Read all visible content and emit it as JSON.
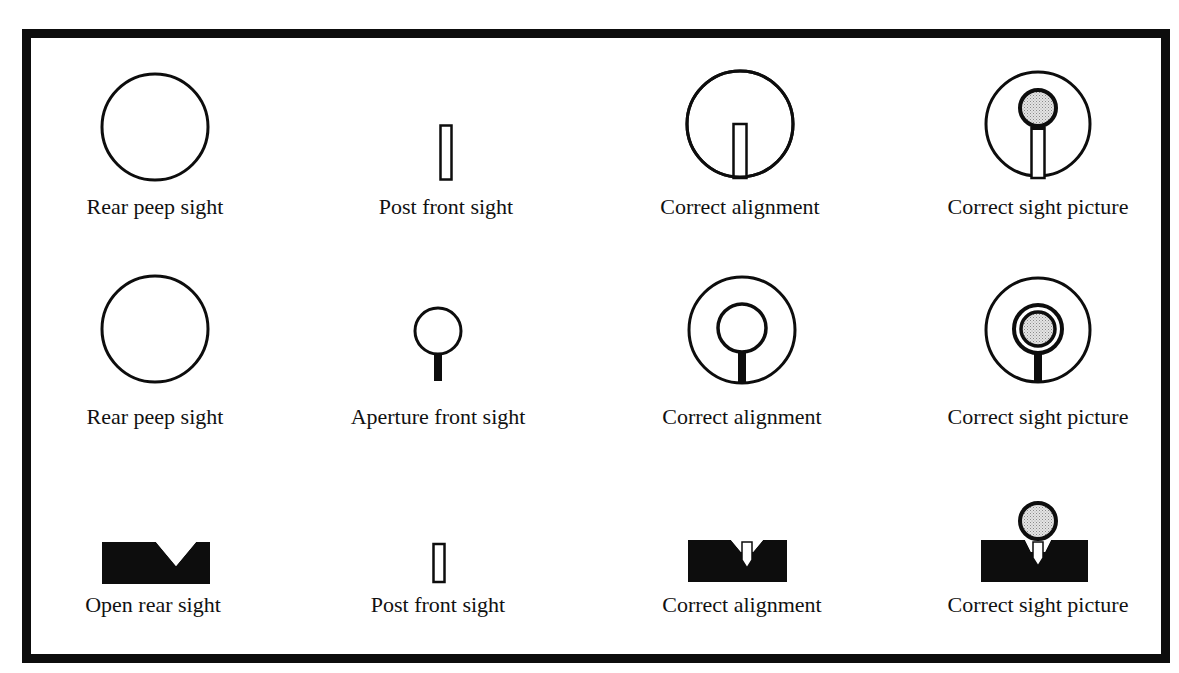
{
  "figure": {
    "rows": [
      {
        "name": "peep-post",
        "items": [
          {
            "label": "Rear peep sight",
            "icon": "rear-peep-sight-icon"
          },
          {
            "label": "Post front sight",
            "icon": "post-front-sight-icon"
          },
          {
            "label": "Correct alignment",
            "icon": "peep-post-alignment-icon"
          },
          {
            "label": "Correct sight picture",
            "icon": "peep-post-sight-picture-icon"
          }
        ]
      },
      {
        "name": "peep-aperture",
        "items": [
          {
            "label": "Rear peep sight",
            "icon": "rear-peep-sight-icon"
          },
          {
            "label": "Aperture front sight",
            "icon": "aperture-front-sight-icon"
          },
          {
            "label": "Correct alignment",
            "icon": "peep-aperture-alignment-icon"
          },
          {
            "label": "Correct sight picture",
            "icon": "peep-aperture-sight-picture-icon"
          }
        ]
      },
      {
        "name": "open-post",
        "items": [
          {
            "label": "Open rear sight",
            "icon": "open-rear-sight-icon"
          },
          {
            "label": "Post front sight",
            "icon": "post-front-sight-icon"
          },
          {
            "label": "Correct alignment",
            "icon": "open-post-alignment-icon"
          },
          {
            "label": "Correct sight picture",
            "icon": "open-post-sight-picture-icon"
          }
        ]
      }
    ],
    "colors": {
      "ink": "#0d0d0d",
      "target_fill": "#cfcfcf",
      "background": "#ffffff"
    }
  }
}
